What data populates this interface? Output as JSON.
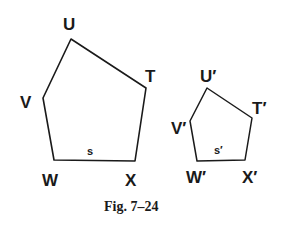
{
  "figure": {
    "caption": "Fig. 7–24",
    "large_pentagon": {
      "vertices": {
        "U": "U",
        "T": "T",
        "X": "X",
        "W": "W",
        "V": "V"
      },
      "side_label": "s"
    },
    "small_pentagon": {
      "vertices": {
        "U": "U′",
        "T": "T′",
        "X": "X′",
        "W": "W′",
        "V": "V′"
      },
      "side_label": "s′"
    },
    "colors": {
      "stroke": "#1a1a1a",
      "background": "#ffffff"
    }
  }
}
